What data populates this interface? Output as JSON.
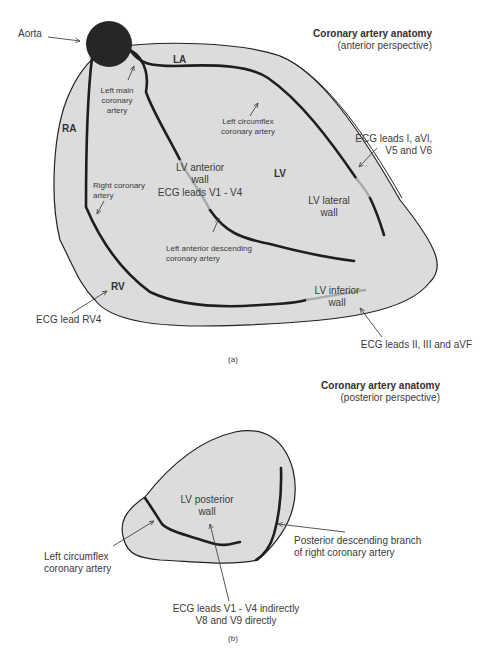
{
  "colors": {
    "heart_fill": "#dcdcdc",
    "outline": "#222222",
    "artery": "#1e1e1e",
    "artery_faded": "#a9a9a9",
    "aorta": "#262626",
    "text": "#3a3a3a",
    "background": "#ffffff"
  },
  "panel_a": {
    "title": "Coronary artery anatomy",
    "subtitle": "(anterior perspective)",
    "caption": "(a)",
    "chambers": {
      "la": "LA",
      "ra": "RA",
      "lv": "LV",
      "rv": "RV"
    },
    "labels": {
      "aorta": "Aorta",
      "left_main_1": "Left main",
      "left_main_2": "coronary",
      "left_main_3": "artery",
      "left_circumflex_1": "Left circumflex",
      "left_circumflex_2": "coronary artery",
      "right_coronary_1": "Right coronary",
      "right_coronary_2": "artery",
      "lv_anterior_1": "LV anterior",
      "lv_anterior_2": "wall",
      "ecg_v1_v4": "ECG leads V1 - V4",
      "lad_1": "Left anterior descending",
      "lad_2": "coronary artery",
      "lv_lateral_1": "LV lateral",
      "lv_lateral_2": "wall",
      "ecg_lateral_1": "ECG leads I, aVl,",
      "ecg_lateral_2": "V5 and V6",
      "lv_inferior_1": "LV inferior",
      "lv_inferior_2": "wall",
      "ecg_inferior": "ECG leads II, III and aVF",
      "ecg_rv4": "ECG lead RV4"
    }
  },
  "panel_b": {
    "title": "Coronary artery anatomy",
    "subtitle": "(posterior perspective)",
    "caption": "(b)",
    "labels": {
      "lv_posterior_1": "LV posterior",
      "lv_posterior_2": "wall",
      "left_circumflex_1": "Left circumflex",
      "left_circumflex_2": "coronary artery",
      "pda_1": "Posterior descending branch",
      "pda_2": "of right coronary artery",
      "ecg_posterior_1": "ECG leads V1 - V4 indirectly",
      "ecg_posterior_2": "V8 and V9 directly"
    }
  }
}
